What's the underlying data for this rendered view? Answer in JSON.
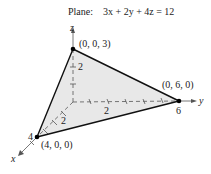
{
  "title": {
    "prefix": "Plane:",
    "equation": "3x + 2y + 4z = 12"
  },
  "axes": {
    "x": "x",
    "y": "y",
    "z": "z"
  },
  "vertices": [
    {
      "label": "(0, 0, 3)"
    },
    {
      "label": "(0, 6, 0)"
    },
    {
      "label": "(4, 0, 0)"
    }
  ],
  "ticks": {
    "z": "2",
    "y_mid": "2",
    "y_end": "6",
    "x_mid": "2",
    "x_end": "4"
  },
  "colors": {
    "fill": "#e8e8e8",
    "edge": "#111111",
    "axis": "#555555"
  }
}
